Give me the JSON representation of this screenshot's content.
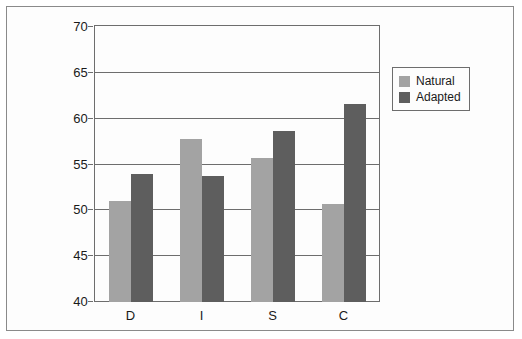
{
  "chart_data": {
    "type": "bar",
    "title": "",
    "subtitle": "",
    "xlabel": "",
    "ylabel": "",
    "categories": [
      "D",
      "I",
      "S",
      "C"
    ],
    "series": [
      {
        "name": "Natural",
        "color": "#a3a3a3",
        "values": [
          51.0,
          57.8,
          55.7,
          50.7
        ]
      },
      {
        "name": "Adapted",
        "color": "#5e5e5e",
        "values": [
          54.0,
          53.8,
          58.7,
          61.6
        ]
      }
    ],
    "ylim": [
      40,
      70
    ],
    "yticks": [
      40,
      45,
      50,
      55,
      60,
      65,
      70
    ],
    "ytick_labels": [
      "40",
      "45",
      "50",
      "55",
      "60",
      "65",
      "70"
    ],
    "grid": true,
    "legend_position": "top-right",
    "legend_entries": [
      "Natural",
      "Adapted"
    ],
    "annotations": []
  },
  "frame": {
    "border_color": "#8a8a8a",
    "background": "#fdfdfd"
  },
  "axis": {
    "line_color": "#6d6d6d",
    "text_color": "#1a1a1a"
  }
}
